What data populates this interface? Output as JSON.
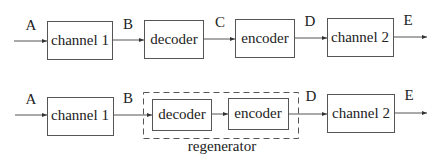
{
  "diagram": {
    "row1": {
      "signals": [
        "A",
        "B",
        "C",
        "D",
        "E"
      ],
      "blocks": [
        "channel 1",
        "decoder",
        "encoder",
        "channel 2"
      ]
    },
    "row2": {
      "signals": [
        "A",
        "B",
        "D",
        "E"
      ],
      "blocks": [
        "channel 1",
        "decoder",
        "encoder",
        "channel 2"
      ],
      "group_label": "regenerator"
    },
    "colors": {
      "stroke": "#555555",
      "text": "#222222",
      "background": "#ffffff"
    }
  }
}
